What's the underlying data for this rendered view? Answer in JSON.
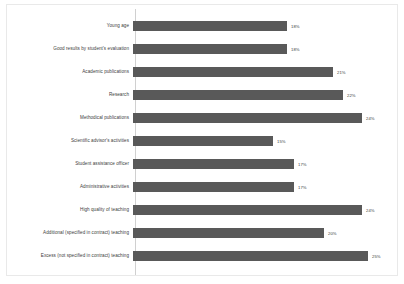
{
  "chart_data": {
    "type": "bar",
    "orientation": "horizontal",
    "title": "",
    "subtitle": "",
    "xlabel": "",
    "ylabel": "",
    "grid": false,
    "legend": false,
    "legend_position": "none",
    "x_tick_labels": [],
    "axis_line": "category-axis-only",
    "value_label_suffix": "%",
    "value_label_position": "outside-end",
    "bar_color": "#595959",
    "label_color": "#404040",
    "background_color": "#ffffff",
    "xlim": [
      13,
      26
    ],
    "categories": [
      "Young age",
      "Good results by student's evaluation",
      "Academic publications",
      "Research",
      "Methodical publications",
      "Scientific advisor's activities",
      "Student assistance officer",
      "Administrative activities",
      "High quality of teaching",
      "Additional (specified in contract) teaching",
      "Excess (not specified in contract) teaching"
    ],
    "values": [
      18,
      18,
      21,
      22,
      24,
      15,
      17,
      17,
      24,
      20,
      25
    ],
    "value_labels": [
      "18%",
      "18%",
      "21%",
      "22%",
      "24%",
      "15%",
      "17%",
      "17%",
      "24%",
      "20%",
      "25%"
    ],
    "bars": [
      {
        "category": "Young age",
        "value": 18,
        "label": "18%",
        "bar_px": 154
      },
      {
        "category": "Good results by student's evaluation",
        "value": 18,
        "label": "18%",
        "bar_px": 154
      },
      {
        "category": "Academic publications",
        "value": 21,
        "label": "21%",
        "bar_px": 200
      },
      {
        "category": "Research",
        "value": 22,
        "label": "22%",
        "bar_px": 210
      },
      {
        "category": "Methodical publications",
        "value": 24,
        "label": "24%",
        "bar_px": 229
      },
      {
        "category": "Scientific advisor's activities",
        "value": 15,
        "label": "15%",
        "bar_px": 140
      },
      {
        "category": "Student assistance officer",
        "value": 17,
        "label": "17%",
        "bar_px": 161
      },
      {
        "category": "Administrative activities",
        "value": 17,
        "label": "17%",
        "bar_px": 161
      },
      {
        "category": "High quality of teaching",
        "value": 24,
        "label": "24%",
        "bar_px": 229
      },
      {
        "category": "Additional (specified in contract) teaching",
        "value": 20,
        "label": "20%",
        "bar_px": 191
      },
      {
        "category": "Excess (not specified in contract) teaching",
        "value": 25,
        "label": "25%",
        "bar_px": 235
      }
    ]
  }
}
